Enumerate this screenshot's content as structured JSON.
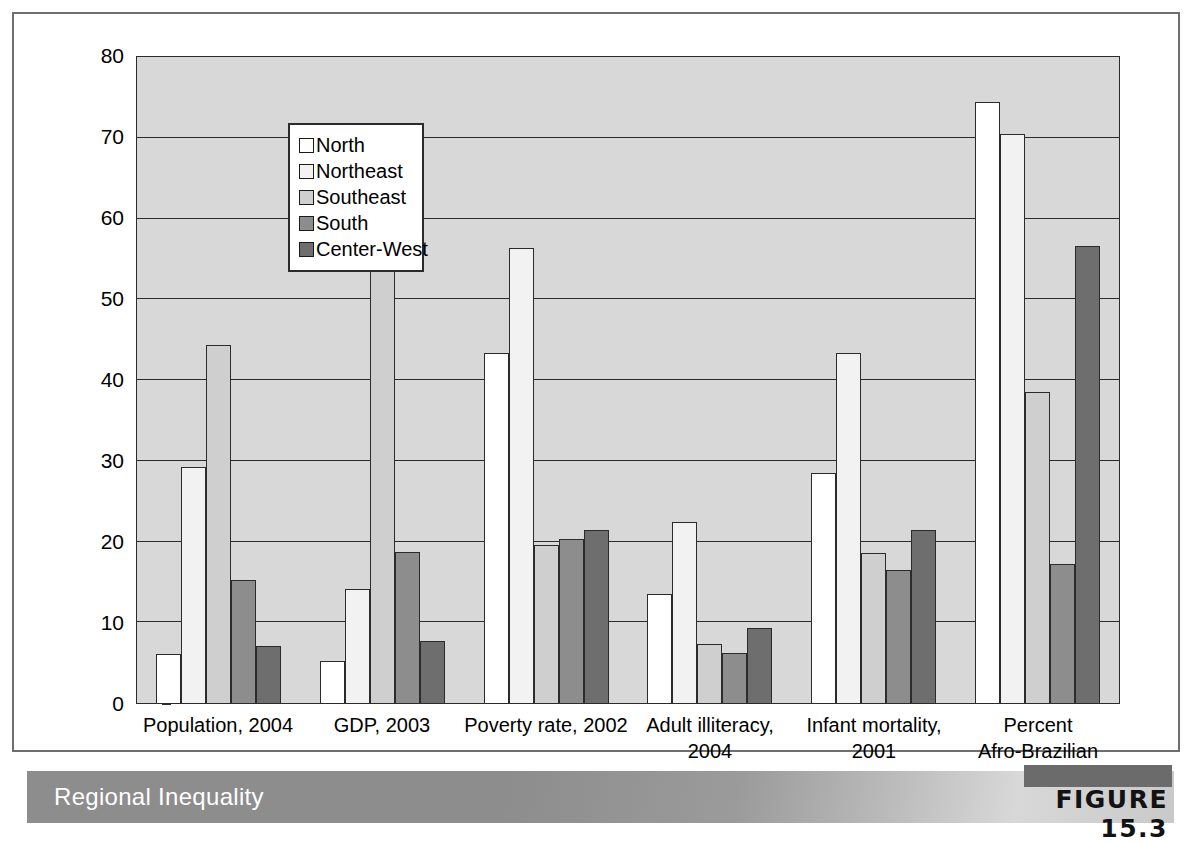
{
  "figure": {
    "caption_title": "Regional Inequality",
    "figure_label": "FIGURE 15.3"
  },
  "chart_data": {
    "type": "bar",
    "title": "Regional Inequality",
    "xlabel": "",
    "ylabel": "",
    "ylim": [
      0,
      80
    ],
    "yticks": [
      0,
      10,
      20,
      30,
      40,
      50,
      60,
      70,
      80
    ],
    "ytick_labels": [
      "0",
      "10",
      "20",
      "30",
      "40",
      "50",
      "60",
      "70",
      "80"
    ],
    "grid": true,
    "legend_position": "upper-left-inside",
    "categories": [
      "Population, 2004",
      "GDP, 2003",
      "Poverty rate, 2002",
      "Adult illiteracy, 2004",
      "Infant mortality, 2001",
      "Percent Afro-Brazilian"
    ],
    "category_lines": [
      [
        "Population, 2004"
      ],
      [
        "GDP, 2003"
      ],
      [
        "Poverty rate, 2002"
      ],
      [
        "Adult illiteracy,",
        "2004"
      ],
      [
        "Infant mortality,",
        "2001"
      ],
      [
        "Percent",
        "Afro-Brazilian"
      ]
    ],
    "series": [
      {
        "name": "North",
        "color": "#ffffff",
        "values": [
          6.0,
          5.2,
          43.2,
          13.4,
          28.4,
          74.2
        ]
      },
      {
        "name": "Northeast",
        "color": "#f2f2f2",
        "values": [
          29.1,
          14.1,
          56.2,
          22.4,
          43.2,
          70.3
        ]
      },
      {
        "name": "Southeast",
        "color": "#cfcfcf",
        "values": [
          44.2,
          55.1,
          19.5,
          7.3,
          18.5,
          38.4
        ]
      },
      {
        "name": "South",
        "color": "#8d8d8d",
        "values": [
          15.2,
          18.7,
          20.2,
          6.2,
          16.4,
          17.2
        ]
      },
      {
        "name": "Center-West",
        "color": "#6e6e6e",
        "values": [
          7.1,
          7.7,
          21.4,
          9.2,
          21.4,
          56.4
        ]
      }
    ]
  }
}
